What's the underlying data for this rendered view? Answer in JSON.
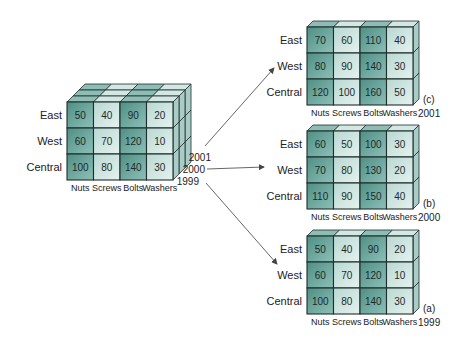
{
  "diagram": {
    "rows": [
      "East",
      "West",
      "Central"
    ],
    "columns": [
      "Nuts",
      "Screws",
      "Bolts",
      "Washers"
    ],
    "cube": {
      "years_stack": [
        "2001",
        "2000",
        "1999"
      ],
      "front_year": "1999",
      "values": [
        [
          50,
          40,
          90,
          20
        ],
        [
          60,
          70,
          120,
          10
        ],
        [
          100,
          80,
          140,
          30
        ]
      ]
    },
    "slices": [
      {
        "tag": "(c)",
        "year": "2001",
        "values": [
          [
            70,
            60,
            110,
            40
          ],
          [
            80,
            90,
            140,
            30
          ],
          [
            120,
            100,
            160,
            50
          ]
        ]
      },
      {
        "tag": "(b)",
        "year": "2000",
        "values": [
          [
            60,
            50,
            100,
            30
          ],
          [
            70,
            80,
            130,
            20
          ],
          [
            110,
            90,
            150,
            40
          ]
        ]
      },
      {
        "tag": "(a)",
        "year": "1999",
        "values": [
          [
            50,
            40,
            90,
            20
          ],
          [
            60,
            70,
            120,
            10
          ],
          [
            100,
            80,
            140,
            30
          ]
        ]
      }
    ],
    "colors": {
      "dark_cell": "#5f9c92",
      "light_cell": "#cfe5e1",
      "top_face": "#8dbdb5",
      "side_face": "#a9ccc6",
      "grid_line": "#1e2e2c",
      "arrow": "#555555"
    }
  }
}
